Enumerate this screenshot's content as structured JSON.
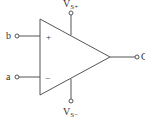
{
  "diagram": {
    "type": "op-amp symbol",
    "inputs": {
      "non_inverting": {
        "label": "b",
        "sign": "+"
      },
      "inverting": {
        "label": "a",
        "sign": "−"
      }
    },
    "output": {
      "label": "C"
    },
    "supply": {
      "positive": {
        "main": "V",
        "sub": "S+"
      },
      "negative": {
        "main": "V",
        "sub": "S−"
      }
    },
    "colors": {
      "stroke": "#555555",
      "text": "#333333",
      "background": "#ffffff"
    }
  }
}
